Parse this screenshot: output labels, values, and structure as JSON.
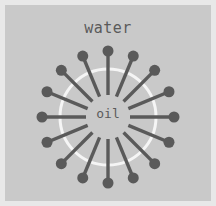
{
  "figure": {
    "title_outer": "water",
    "title_inner": "oil",
    "width": 216,
    "height": 206,
    "background_color": "#c9c9c9",
    "frame_color": "#e8e8e8",
    "molecule_color": "#5a5a5a",
    "interface_color": "#f5f5f5",
    "text_color": "#5a5a5a"
  },
  "diagram": {
    "type": "micelle",
    "center_x": 108,
    "center_y": 117,
    "interface_radius": 48,
    "interface_stroke_width": 3,
    "head_radius": 5.5,
    "head_orbit_radius": 66,
    "tail_inner_radius": 22,
    "tail_stroke_width": 3.4,
    "molecule_count": 16,
    "angle_step_degrees": 22.5,
    "start_angle_degrees": -90,
    "angles": [
      -90,
      -67.5,
      -45,
      -22.5,
      0,
      22.5,
      45,
      67.5,
      90,
      112.5,
      135,
      157.5,
      180,
      202.5,
      225,
      247.5
    ]
  },
  "labels": {
    "water": {
      "text": "water",
      "x": 108,
      "y": 28,
      "font_size": 15
    },
    "oil": {
      "text": "oil",
      "x": 108,
      "y": 114,
      "font_size": 13
    }
  }
}
